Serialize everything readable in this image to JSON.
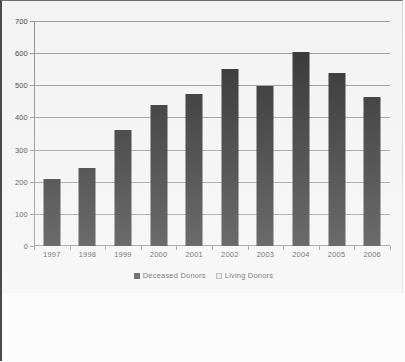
{
  "chart_data": {
    "type": "bar",
    "title": "",
    "subtitle": "",
    "xlabel": "",
    "ylabel": "",
    "categories": [
      "1997",
      "1998",
      "1999",
      "2000",
      "2001",
      "2002",
      "2003",
      "2004",
      "2005",
      "2006"
    ],
    "series": [
      {
        "name": "Deceased Donors",
        "color": "#2e2e2e",
        "values": [
          208,
          243,
          361,
          439,
          473,
          551,
          498,
          603,
          538,
          464
        ]
      },
      {
        "name": "Living Donors",
        "color": "#e2e2e2",
        "values": [
          0,
          0,
          0,
          0,
          0,
          0,
          0,
          0,
          0,
          0
        ]
      }
    ],
    "ylim": [
      0,
      700
    ],
    "ytick_step": 100,
    "yticks": [
      "0",
      "100",
      "200",
      "300",
      "400",
      "500",
      "600",
      "700"
    ],
    "grid": true,
    "grid_axis": "y",
    "legend_position": "bottom",
    "legend": [
      {
        "label": "Deceased Donors",
        "swatch": "filled-dark-square"
      },
      {
        "label": "Living Donors",
        "swatch": "light-outlined-square"
      }
    ]
  }
}
